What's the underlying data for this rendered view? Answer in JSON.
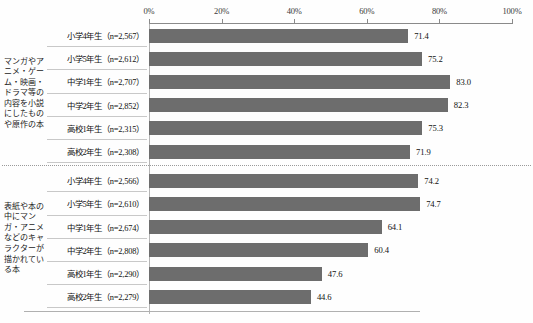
{
  "chart_data": {
    "type": "bar",
    "orientation": "horizontal",
    "title": "",
    "xlabel": "",
    "ylabel": "",
    "xlim": [
      0,
      100
    ],
    "grid": false,
    "legend": "none",
    "axis_ticks": [
      "0%",
      "20%",
      "40%",
      "60%",
      "80%",
      "100%"
    ],
    "axis_tick_values": [
      0,
      20,
      40,
      60,
      80,
      100
    ],
    "bar_color": "#6d6d6d",
    "groups": [
      {
        "label": "マンガやアニメ・ゲーム・映画・ドラマ等の内容を小説にしたものや原作の本",
        "categories": [
          "小学4年生（n=2,567）",
          "小学5年生（n=2,612）",
          "中学1年生（n=2,707）",
          "中学2年生（n=2,852）",
          "高校1年生（n=2,315）",
          "高校2年生（n=2,308）"
        ],
        "values": [
          71.4,
          75.2,
          83.0,
          82.3,
          75.3,
          71.9
        ],
        "value_labels": [
          "71.4",
          "75.2",
          "83.0",
          "82.3",
          "75.3",
          "71.9"
        ]
      },
      {
        "label": "表紙や本の中にマンガ・アニメなどのキャラクターが描かれている本",
        "categories": [
          "小学4年生（n=2,566）",
          "小学5年生（n=2,610）",
          "中学1年生（n=2,674）",
          "中学2年生（n=2,808）",
          "高校1年生（n=2,290）",
          "高校2年生（n=2,279）"
        ],
        "values": [
          74.2,
          74.7,
          64.1,
          60.4,
          47.6,
          44.6
        ],
        "value_labels": [
          "74.2",
          "74.7",
          "64.1",
          "60.4",
          "47.6",
          "44.6"
        ]
      }
    ]
  }
}
